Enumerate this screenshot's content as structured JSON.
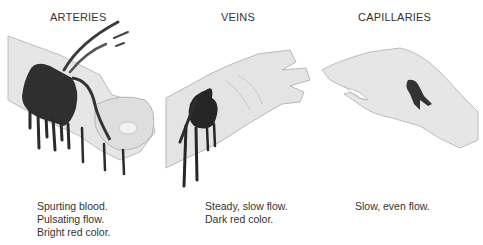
{
  "panels": [
    {
      "id": "arteries",
      "heading": "ARTERIES",
      "caption_lines": [
        "Spurting blood.",
        "Pulsating flow.",
        "Bright red color."
      ],
      "illustration": "wrist-with-spurting-blood-icon"
    },
    {
      "id": "veins",
      "heading": "VEINS",
      "caption_lines": [
        "Steady, slow flow.",
        "Dark red color."
      ],
      "illustration": "wrist-with-flowing-blood-icon"
    },
    {
      "id": "capillaries",
      "heading": "CAPILLARIES",
      "caption_lines": [
        "Slow, even flow."
      ],
      "illustration": "hand-with-oozing-blood-icon"
    }
  ],
  "colors": {
    "skin_fill": "#e4e4e4",
    "skin_shade": "#c8c8c8",
    "skin_outline": "#b5b5b5",
    "blood": "#2b2b2b",
    "text": "#333333"
  }
}
